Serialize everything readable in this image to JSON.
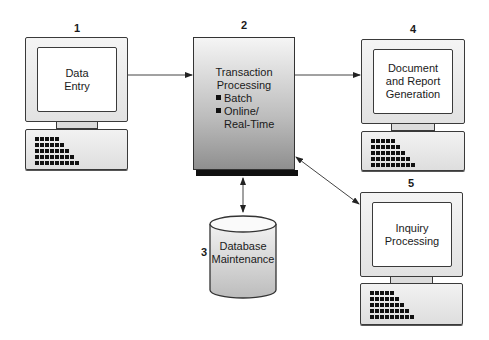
{
  "diagram": {
    "nodes": [
      {
        "id": "1",
        "number": "1",
        "type": "terminal",
        "label_lines": [
          "Data",
          "Entry"
        ]
      },
      {
        "id": "2",
        "number": "2",
        "type": "process",
        "title_lines": [
          "Transaction",
          "Processing"
        ],
        "bullets": [
          "Batch",
          "Online/"
        ],
        "bullet_continuation": "Real-Time"
      },
      {
        "id": "3",
        "number": "3",
        "type": "database",
        "label_lines": [
          "Database",
          "Maintenance"
        ]
      },
      {
        "id": "4",
        "number": "4",
        "type": "terminal",
        "label_lines": [
          "Document",
          "and Report",
          "Generation"
        ]
      },
      {
        "id": "5",
        "number": "5",
        "type": "terminal",
        "label_lines": [
          "Inquiry",
          "Processing"
        ]
      }
    ],
    "edges": [
      {
        "from": "1",
        "to": "2",
        "direction": "forward"
      },
      {
        "from": "2",
        "to": "4",
        "direction": "forward"
      },
      {
        "from": "2",
        "to": "3",
        "direction": "bidirectional"
      },
      {
        "from": "2",
        "to": "5",
        "direction": "bidirectional"
      }
    ],
    "colors": {
      "stroke": "#333333",
      "dots": "#111111",
      "screen": "#ffffff",
      "process_top": "#f5f5f5",
      "process_bottom": "#8f8f8f"
    }
  }
}
